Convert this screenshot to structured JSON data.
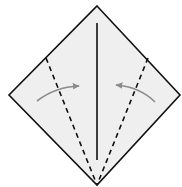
{
  "diagram": {
    "type": "origami-fold-step",
    "colors": {
      "paper": "#efefef",
      "outline": "#111111",
      "crease": "#111111",
      "valley_fold": "#111111",
      "arrow": "#8c8c8c"
    },
    "paper": {
      "top": [
        97,
        6
      ],
      "right": [
        180,
        95
      ],
      "bottom": [
        97,
        185
      ],
      "left": [
        9,
        95
      ]
    },
    "center_crease": {
      "from": [
        97,
        23
      ],
      "to": [
        97,
        160
      ]
    },
    "valley_folds": [
      {
        "side": "left",
        "from": [
          46,
          58
        ],
        "to": [
          97,
          185
        ]
      },
      {
        "side": "right",
        "from": [
          148,
          58
        ],
        "to": [
          97,
          185
        ]
      }
    ],
    "arrows": [
      {
        "side": "left",
        "direction": "toward-center",
        "from": [
          37,
          101
        ],
        "ctrl": [
          55,
          87
        ],
        "to": [
          79,
          86
        ]
      },
      {
        "side": "right",
        "direction": "toward-center",
        "from": [
          155,
          102
        ],
        "ctrl": [
          140,
          87
        ],
        "to": [
          116,
          85
        ]
      }
    ]
  }
}
